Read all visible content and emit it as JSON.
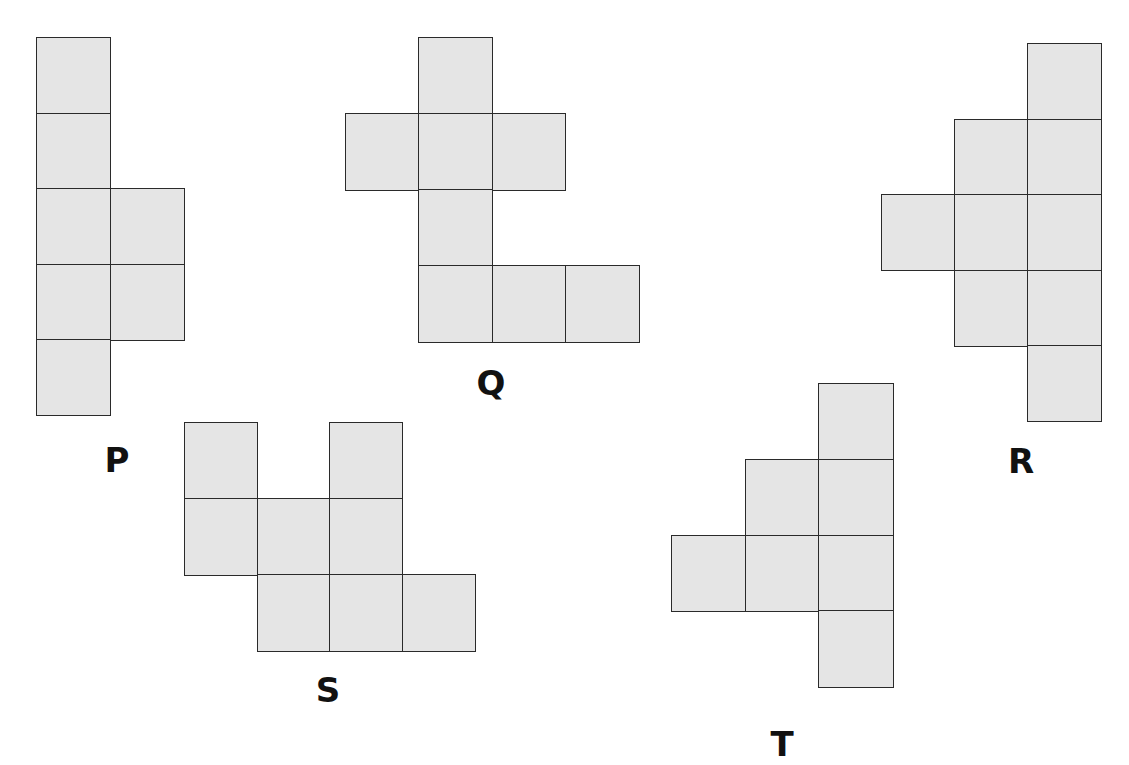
{
  "diagram": {
    "title": "",
    "cell_size": 74,
    "fill_color": "#e5e5e5",
    "border_color": "#2a2a2a",
    "figures": [
      {
        "id": "P",
        "label": "P",
        "origin": [
          36,
          37
        ],
        "cell_w": 73.5,
        "cell_h": 75.6,
        "cells": [
          [
            0,
            0
          ],
          [
            0,
            1
          ],
          [
            0,
            2
          ],
          [
            1,
            2
          ],
          [
            0,
            3
          ],
          [
            1,
            3
          ],
          [
            0,
            4
          ]
        ],
        "label_pos": [
          117,
          460
        ]
      },
      {
        "id": "Q",
        "label": "Q",
        "origin": [
          345,
          37
        ],
        "cell_w": 73.3,
        "cell_h": 76,
        "cells": [
          [
            1,
            0
          ],
          [
            0,
            1
          ],
          [
            1,
            1
          ],
          [
            2,
            1
          ],
          [
            1,
            2
          ],
          [
            1,
            3
          ],
          [
            2,
            3
          ],
          [
            3,
            3
          ]
        ],
        "label_pos": [
          491,
          383
        ]
      },
      {
        "id": "R",
        "label": "R",
        "origin": [
          881,
          43
        ],
        "cell_w": 73,
        "cell_h": 75.6,
        "cells": [
          [
            2,
            0
          ],
          [
            1,
            1
          ],
          [
            2,
            1
          ],
          [
            0,
            2
          ],
          [
            1,
            2
          ],
          [
            2,
            2
          ],
          [
            1,
            3
          ],
          [
            2,
            3
          ],
          [
            2,
            4
          ]
        ],
        "label_pos": [
          1021,
          461
        ]
      },
      {
        "id": "S",
        "label": "S",
        "origin": [
          184,
          422
        ],
        "cell_w": 72.5,
        "cell_h": 76,
        "cells": [
          [
            0,
            0
          ],
          [
            2,
            0
          ],
          [
            0,
            1
          ],
          [
            1,
            1
          ],
          [
            2,
            1
          ],
          [
            1,
            2
          ],
          [
            2,
            2
          ],
          [
            3,
            2
          ]
        ],
        "label_pos": [
          328,
          690
        ]
      },
      {
        "id": "T",
        "label": "T",
        "origin": [
          671,
          383
        ],
        "cell_w": 73.7,
        "cell_h": 75.8,
        "cells": [
          [
            2,
            0
          ],
          [
            1,
            1
          ],
          [
            2,
            1
          ],
          [
            0,
            2
          ],
          [
            1,
            2
          ],
          [
            2,
            2
          ],
          [
            2,
            3
          ]
        ],
        "label_pos": [
          782,
          744
        ]
      }
    ]
  }
}
